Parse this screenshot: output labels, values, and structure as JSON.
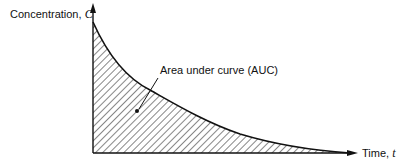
{
  "diagram": {
    "type": "pharmacokinetic concentration-time curve",
    "y_axis": {
      "label": "Concentration",
      "symbol": "C"
    },
    "x_axis": {
      "label": "Time",
      "symbol": "t"
    },
    "annotation": "Area under curve (AUC)",
    "curve": "exponential decay",
    "shaded_region": "hatched area under curve"
  },
  "colors": {
    "ink": "#111111",
    "background": "#ffffff"
  }
}
